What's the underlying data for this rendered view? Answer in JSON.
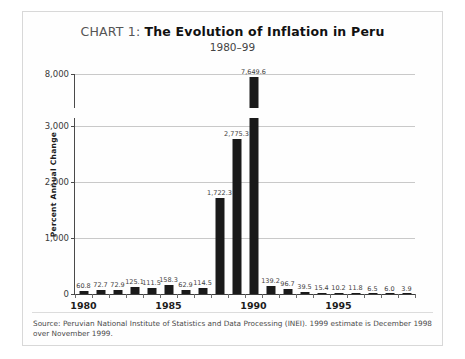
{
  "chart_data": {
    "type": "bar",
    "title": "CHART 1: The Evolution of Inflation in Peru",
    "title_prefix": "CHART 1: ",
    "title_main": "The Evolution of Inflation in Peru",
    "subtitle": "1980–99",
    "xlabel": "",
    "ylabel": "Percent Annual Change",
    "categories": [
      1980,
      1981,
      1982,
      1983,
      1984,
      1985,
      1986,
      1987,
      1988,
      1989,
      1990,
      1991,
      1992,
      1993,
      1994,
      1995,
      1996,
      1997,
      1998,
      1999
    ],
    "values": [
      60.8,
      72.7,
      72.9,
      125.1,
      111.5,
      158.3,
      62.9,
      114.5,
      1722.3,
      2775.3,
      7649.6,
      139.2,
      96.7,
      39.5,
      15.4,
      10.2,
      11.8,
      6.5,
      6.0,
      3.9
    ],
    "value_labels": [
      "60.8",
      "72.7",
      "72.9",
      "125.1",
      "111.5",
      "158.3",
      "62.9",
      "114.5",
      "1,722.3",
      "2,775.3",
      "7,649.6",
      "139.2",
      "96.7",
      "39.5",
      "15.4",
      "10.2",
      "11.8",
      "6.5",
      "6.0",
      "3.9"
    ],
    "ytick_labels": [
      "0",
      "1,000",
      "2,000",
      "3,000",
      "8,000"
    ],
    "ytick_values": [
      0,
      1000,
      2000,
      3000,
      8000
    ],
    "xtick_labels": [
      "1980",
      "1985",
      "1990",
      "1995"
    ],
    "xtick_values": [
      1980,
      1985,
      1990,
      1995
    ],
    "ylim": [
      0,
      8000
    ],
    "axis_break": {
      "present": true,
      "between": [
        3000,
        8000
      ]
    },
    "grid": true,
    "legend": "none",
    "bar_color": "#1a1a1a"
  },
  "source": {
    "note": "Source: Peruvian National Institute of Statistics and Data Processing (INEI). 1999 estimate is December 1998 over November 1999."
  }
}
